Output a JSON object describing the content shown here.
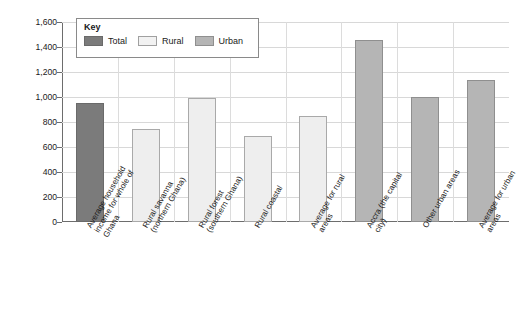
{
  "chart_data": {
    "type": "bar",
    "title": "",
    "subtitle": "",
    "xlabel": "",
    "ylabel": "Average annual household income (US$)",
    "ylim": [
      0,
      1600
    ],
    "ytick_step": 200,
    "yticks": [
      "0",
      "200",
      "400",
      "600",
      "800",
      "1,000",
      "1,200",
      "1,400",
      "1,600"
    ],
    "grid": true,
    "legend_position": "top-left",
    "legend_title": "Key",
    "legend": [
      {
        "name": "Total",
        "color": "#7b7b7b"
      },
      {
        "name": "Rural",
        "color": "#f2f2f2"
      },
      {
        "name": "Urban",
        "color": "#b5b5b5"
      }
    ],
    "categories": [
      "Average household income for whole of Ghana",
      "Rural savanna (northern Ghana)",
      "Rural forest (southern Ghana)",
      "Rural coastal",
      "Average for rural areas",
      "Accra (the capital city)",
      "Other urban areas",
      "Average for urban areas"
    ],
    "category_lines": [
      "Average household\nincome for whole of\nGhana",
      "Rural savanna\n(northern Ghana)",
      "Rural forest\n(southern Ghana)",
      "Rural coastal",
      "Average for rural\nareas",
      "Accra (the capital\ncity)",
      "Other urban areas",
      "Average for urban\nareas"
    ],
    "values": [
      955,
      745,
      990,
      685,
      850,
      1460,
      1000,
      1135
    ],
    "groups": [
      "Total",
      "Rural",
      "Rural",
      "Rural",
      "Rural",
      "Urban",
      "Urban",
      "Urban"
    ],
    "group_classes": [
      "total",
      "rural",
      "rural",
      "rural",
      "rural",
      "urban",
      "urban",
      "urban"
    ]
  }
}
